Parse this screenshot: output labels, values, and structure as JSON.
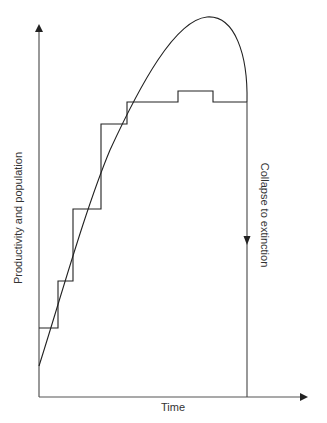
{
  "diagram": {
    "axes": {
      "x_label": "Time",
      "y_label": "Productivity and population"
    },
    "annotations": {
      "collapse": "Collapse to extinction"
    },
    "series": [
      {
        "name": "population-curve",
        "type": "smooth-curve",
        "description": "Rises, peaks, then collapses abruptly"
      },
      {
        "name": "productivity-steps",
        "type": "step-function",
        "description": "Productivity increases in steps, plateaus with small bump, then collapses"
      }
    ],
    "colors": {
      "line": "#222222",
      "axis": "#555555",
      "text": "#333333",
      "background": "#ffffff"
    }
  }
}
